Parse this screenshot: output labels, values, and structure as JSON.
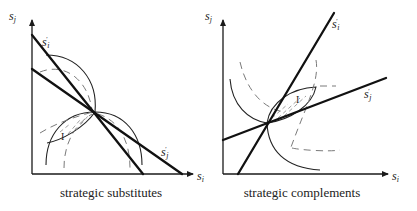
{
  "panels": [
    {
      "id": "substitutes",
      "caption": "strategic substitutes",
      "axis_x_label": "s",
      "axis_x_sub": "i",
      "axis_y_label": "s",
      "axis_y_sub": "j",
      "reaction_i_label": "s",
      "reaction_i_sub": "i",
      "reaction_i_sup": "'",
      "reaction_j_label": "s",
      "reaction_j_sub": "j",
      "reaction_j_sup": "'",
      "region_label": "I"
    },
    {
      "id": "complements",
      "caption": "strategic complements",
      "axis_x_label": "s",
      "axis_x_sub": "i",
      "axis_y_label": "s",
      "axis_y_sub": "j",
      "reaction_i_label": "s",
      "reaction_i_sub": "i",
      "reaction_i_sup": "'",
      "reaction_j_label": "s",
      "reaction_j_sub": "j",
      "reaction_j_sup": "'",
      "region_label": "I"
    }
  ],
  "colors": {
    "lines": "#111111",
    "dashed": "#7a7a7a",
    "background": "#ffffff"
  }
}
